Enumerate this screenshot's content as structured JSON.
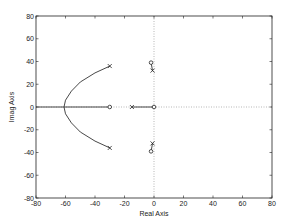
{
  "chart_data": {
    "type": "line",
    "title": "",
    "xlabel": "Real Axis",
    "ylabel": "Imag Axis",
    "xlim": [
      -80,
      80
    ],
    "ylim": [
      -80,
      80
    ],
    "x_ticks": [
      -80,
      -60,
      -40,
      -20,
      0,
      20,
      40,
      60,
      80
    ],
    "y_ticks": [
      -80,
      -60,
      -40,
      -20,
      0,
      20,
      40,
      60,
      80
    ],
    "grid": "dotted lines at x=0 and y=0",
    "legend": null,
    "poles": [
      {
        "re": -30,
        "im": 36
      },
      {
        "re": -30,
        "im": -36
      },
      {
        "re": -15,
        "im": 0
      },
      {
        "re": -1,
        "im": 32
      },
      {
        "re": -1,
        "im": -32
      }
    ],
    "zeros": [
      {
        "re": -30,
        "im": 0
      },
      {
        "re": 0,
        "im": 0
      },
      {
        "re": -2,
        "im": 39
      },
      {
        "re": -2,
        "im": -39
      }
    ],
    "branches": [
      {
        "name": "complex-upper",
        "points": [
          [
            -30,
            36
          ],
          [
            -40,
            30
          ],
          [
            -50,
            22
          ],
          [
            -56,
            14
          ],
          [
            -60,
            6
          ],
          [
            -61,
            0
          ]
        ]
      },
      {
        "name": "complex-lower",
        "points": [
          [
            -30,
            -36
          ],
          [
            -40,
            -30
          ],
          [
            -50,
            -22
          ],
          [
            -56,
            -14
          ],
          [
            -60,
            -6
          ],
          [
            -61,
            0
          ]
        ]
      },
      {
        "name": "real-axis-left",
        "points": [
          [
            -80,
            0
          ],
          [
            -30,
            0
          ]
        ]
      },
      {
        "name": "real-axis-right",
        "points": [
          [
            -15,
            0
          ],
          [
            0,
            0
          ]
        ]
      },
      {
        "name": "near-origin-upper",
        "points": [
          [
            -1,
            32
          ],
          [
            -2,
            39
          ]
        ]
      },
      {
        "name": "near-origin-lower",
        "points": [
          [
            -1,
            -32
          ],
          [
            -2,
            -39
          ]
        ]
      }
    ],
    "breakaway_point": {
      "re": -61,
      "im": 0
    }
  },
  "labels": {
    "xlabel": "Real Axis",
    "ylabel": "Imag Axis"
  }
}
